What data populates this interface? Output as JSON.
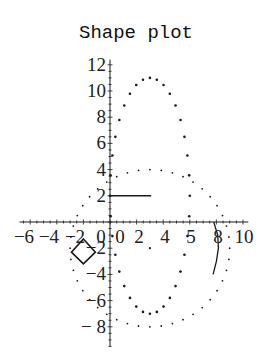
{
  "chart_data": {
    "type": "scatter",
    "title": "Shape plot",
    "xlabel": "",
    "ylabel": "",
    "xlim": [
      -6.8,
      10.4
    ],
    "ylim": [
      -9.5,
      12.4
    ],
    "grid": false,
    "legend": null,
    "x_ticks": [
      -6,
      -4,
      -2,
      0,
      2,
      4,
      6,
      8,
      10
    ],
    "x_tick_labels": [
      "-6",
      "-4",
      "-2",
      "0",
      "0",
      "2",
      "4",
      "5",
      "8",
      "10"
    ],
    "y_ticks": [
      12,
      10,
      8,
      6,
      4,
      2,
      -2,
      -4,
      -6,
      -8
    ],
    "y_tick_labels": [
      "12",
      "10",
      "8",
      "6",
      "4",
      "2",
      "-2",
      "-4",
      "-6",
      "-8"
    ],
    "series": [
      {
        "name": "ellipse-dense",
        "kind": "dotted-ellipse",
        "center": [
          3,
          2
        ],
        "rx": 3,
        "ry": 9,
        "points": 36,
        "dot_radius": 1.3
      },
      {
        "name": "circle-sparse",
        "kind": "dotted-ellipse",
        "center": [
          3,
          -2
        ],
        "rx": 6,
        "ry": 6,
        "points": 44,
        "dot_radius": 0.9
      },
      {
        "name": "center-point",
        "kind": "points",
        "points": [
          [
            3,
            -2
          ]
        ],
        "dot_radius": 1.1
      },
      {
        "name": "horizontal-segment",
        "kind": "line",
        "points": [
          [
            0,
            2
          ],
          [
            3.1,
            2
          ]
        ]
      },
      {
        "name": "diamond",
        "kind": "polygon",
        "points": [
          [
            -2,
            -1.3
          ],
          [
            -1.1,
            -2.3
          ],
          [
            -2,
            -3.2
          ],
          [
            -2.9,
            -2.3
          ]
        ]
      },
      {
        "name": "arc",
        "kind": "curve",
        "points": [
          [
            7.8,
            0
          ],
          [
            8.1,
            -1
          ],
          [
            8.15,
            -2
          ],
          [
            8.0,
            -3
          ],
          [
            7.75,
            -4
          ]
        ]
      }
    ]
  },
  "render": {
    "origin_px": [
      110,
      222
    ],
    "scale_px": [
      13.3,
      13.1
    ],
    "title_pos": [
      136,
      38
    ],
    "ink": "#1a1a1a"
  }
}
